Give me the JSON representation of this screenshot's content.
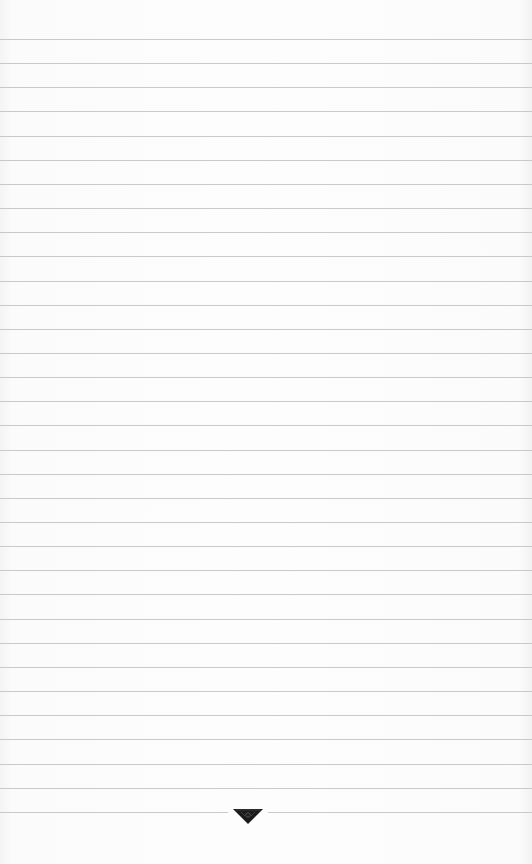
{
  "paper": {
    "type": "lined-paper",
    "background_color": "#fbfbfb",
    "rule_color": "#c9c9c9",
    "rule_count": 33,
    "first_rule_y": 39,
    "rule_spacing": 24.15
  },
  "emblem": {
    "icon": "inverted-triangle-emblem-icon",
    "color": "#1a1a1a"
  }
}
